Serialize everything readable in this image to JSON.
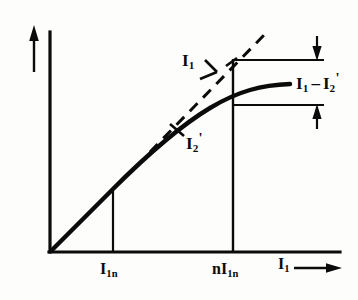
{
  "figure": {
    "type": "line-diagram",
    "background_color": "#fdfdfb",
    "ink_color": "#0b0b0b"
  },
  "axes": {
    "y_axis": {
      "name": "vertical-axis",
      "label": "",
      "arrow": "up",
      "origin_px": [
        50,
        252
      ],
      "top_px": [
        50,
        32
      ]
    },
    "x_axis": {
      "name": "horizontal-axis",
      "label_main": "I",
      "label_sub": "1",
      "arrow": "right",
      "origin_px": [
        50,
        252
      ],
      "end_px": [
        340,
        252
      ]
    }
  },
  "ticks": [
    {
      "label_main": "I",
      "label_sub": "1n",
      "x_px": 113
    },
    {
      "label_main": "nI",
      "label_sub": "1n",
      "x_px": 233
    }
  ],
  "curves": [
    {
      "name": "saturation-curve",
      "style": "solid",
      "stroke_width": 4,
      "label_main": "I",
      "label_sub": "2",
      "label_prime": "'"
    },
    {
      "name": "linear-asymptote",
      "style": "dashed",
      "stroke_width": 3,
      "label_main": "I",
      "label_sub": "1",
      "label_prime": ""
    }
  ],
  "annotations": {
    "difference_label": {
      "name": "current-difference",
      "text_left": "I",
      "sub_left": "1",
      "minus": "–",
      "text_right": "I",
      "sub_right": "2",
      "prime_right": "'"
    },
    "dimension_top_y_px": 60,
    "dimension_bottom_y_px": 105,
    "dimension_x_start_px": 233,
    "dimension_x_end_px": 320
  }
}
